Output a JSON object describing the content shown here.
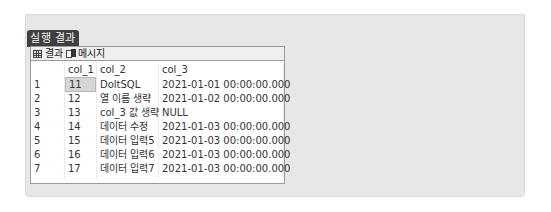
{
  "panel": {
    "title": "실행 결과"
  },
  "tabs": [
    {
      "label": "결과",
      "icon": "grid-icon",
      "active": true
    },
    {
      "label": "메시지",
      "icon": "message-icon",
      "active": false
    }
  ],
  "grid": {
    "columns": [
      "col_1",
      "col_2",
      "col_3"
    ],
    "selected_cell": {
      "row": 0,
      "column": "col_1"
    },
    "rows": [
      {
        "num": "1",
        "col_1": "11",
        "col_2": "DoltSQL",
        "col_3": "2021-01-01 00:00:00.000"
      },
      {
        "num": "2",
        "col_1": "12",
        "col_2": "열 이름 생략",
        "col_3": "2021-01-02 00:00:00.000"
      },
      {
        "num": "3",
        "col_1": "13",
        "col_2": "col_3 값 생략",
        "col_3": "NULL"
      },
      {
        "num": "4",
        "col_1": "14",
        "col_2": "데이터 수정",
        "col_3": "2021-01-03 00:00:00.000"
      },
      {
        "num": "5",
        "col_1": "15",
        "col_2": "데이터 입력5",
        "col_3": "2021-01-03 00:00:00.000"
      },
      {
        "num": "6",
        "col_1": "16",
        "col_2": "데이터 입력6",
        "col_3": "2021-01-03 00:00:00.000"
      },
      {
        "num": "7",
        "col_1": "17",
        "col_2": "데이터 입력7",
        "col_3": "2021-01-03 00:00:00.000"
      }
    ]
  }
}
